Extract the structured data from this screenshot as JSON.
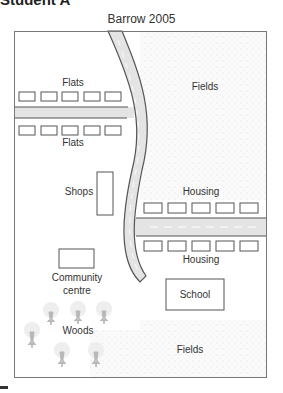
{
  "heading": "Student A",
  "map": {
    "title": "Barrow 2005",
    "labels": {
      "flats_top": "Flats",
      "flats_bottom": "Flats",
      "fields_top": "Fields",
      "shops": "Shops",
      "housing_top": "Housing",
      "housing_bottom": "Housing",
      "community_line1": "Community",
      "community_line2": "centre",
      "school": "School",
      "woods": "Woods",
      "fields_bottom": "Fields"
    },
    "colors": {
      "road_fill": "#e4e4e4",
      "road_edge": "#555555",
      "frame": "#777777",
      "field_texture": "#f2f2f2",
      "tree": "#b5b5b5"
    }
  }
}
